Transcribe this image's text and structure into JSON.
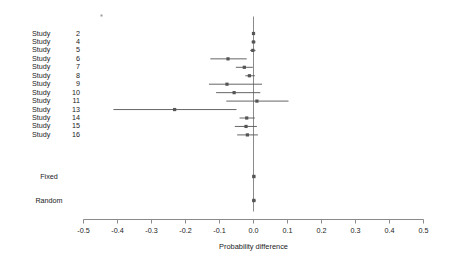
{
  "chart_data": {
    "type": "scatter",
    "subtype": "forest-plot",
    "title": "",
    "xlabel": "Probability difference",
    "ylabel": "",
    "xlim": [
      -0.5,
      0.5
    ],
    "xticks": [
      -0.5,
      -0.4,
      -0.3,
      -0.2,
      -0.1,
      0.0,
      0.1,
      0.2,
      0.3,
      0.4,
      0.5
    ],
    "xticklabels": [
      "-0.5",
      "-0.4",
      "-0.3",
      "-0.2",
      "-0.1",
      "0.0",
      "0.1",
      "0.2",
      "0.3",
      "0.4",
      "0.5"
    ],
    "grid": false,
    "legend": false,
    "reference_line": 0.0,
    "marker": "square",
    "marker_color": "#555555",
    "line_color": "#555555",
    "axis_color": "#808080",
    "rows": [
      {
        "label": "Study",
        "number": "2",
        "estimate": 0.0,
        "ci_low": -0.004,
        "ci_high": 0.004
      },
      {
        "label": "Study",
        "number": "4",
        "estimate": 0.0,
        "ci_low": -0.006,
        "ci_high": 0.006
      },
      {
        "label": "Study",
        "number": "5",
        "estimate": -0.002,
        "ci_low": -0.01,
        "ci_high": 0.006
      },
      {
        "label": "Study",
        "number": "6",
        "estimate": -0.075,
        "ci_low": -0.127,
        "ci_high": -0.02
      },
      {
        "label": "Study",
        "number": "7",
        "estimate": -0.027,
        "ci_low": -0.052,
        "ci_high": -0.002
      },
      {
        "label": "Study",
        "number": "8",
        "estimate": -0.012,
        "ci_low": -0.024,
        "ci_high": 0.004
      },
      {
        "label": "Study",
        "number": "9",
        "estimate": -0.078,
        "ci_low": -0.131,
        "ci_high": 0.025
      },
      {
        "label": "Study",
        "number": "10",
        "estimate": -0.057,
        "ci_low": -0.11,
        "ci_high": 0.02
      },
      {
        "label": "Study",
        "number": "11",
        "estimate": 0.01,
        "ci_low": -0.08,
        "ci_high": 0.103
      },
      {
        "label": "Study",
        "number": "13",
        "estimate": -0.232,
        "ci_low": -0.412,
        "ci_high": -0.05
      },
      {
        "label": "Study",
        "number": "14",
        "estimate": -0.02,
        "ci_low": -0.041,
        "ci_high": 0.004
      },
      {
        "label": "Study",
        "number": "15",
        "estimate": -0.022,
        "ci_low": -0.055,
        "ci_high": 0.01
      },
      {
        "label": "Study",
        "number": "16",
        "estimate": -0.018,
        "ci_low": -0.048,
        "ci_high": 0.013
      }
    ],
    "summaries": [
      {
        "label": "Fixed",
        "estimate": 0.001,
        "ci_low": -0.002,
        "ci_high": 0.005
      },
      {
        "label": "Random",
        "estimate": 0.001,
        "ci_low": -0.004,
        "ci_high": 0.006
      }
    ]
  },
  "axis": {
    "title": "Probability difference",
    "ticks": [
      "-0.5",
      "-0.4",
      "-0.3",
      "-0.2",
      "-0.1",
      "0.0",
      "0.1",
      "0.2",
      "0.3",
      "0.4",
      "0.5"
    ]
  },
  "colors": {
    "marker": "#555555",
    "line": "#555555",
    "axis": "#8a8a8a",
    "text": "#1a1a1a"
  }
}
